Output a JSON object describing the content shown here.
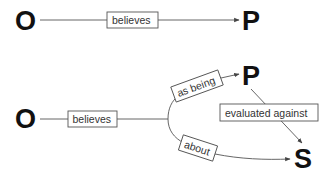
{
  "diagram_top": {
    "source_node": "O",
    "target_node": "P",
    "edge_label": "believes"
  },
  "diagram_bottom": {
    "source_node": "O",
    "node_p": "P",
    "node_s": "S",
    "main_edge_label": "believes",
    "upper_branch_label": "as being",
    "lower_branch_label": "about",
    "cross_edge_label": "evaluated against"
  },
  "colors": {
    "node_text": "#111111",
    "edge": "#555555",
    "label_text": "#333333",
    "background": "#ffffff"
  }
}
